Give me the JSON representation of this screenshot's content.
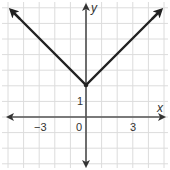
{
  "chart_data": {
    "type": "line",
    "title": "",
    "function": "y = |x| + 2",
    "xlabel": "x",
    "ylabel": "y",
    "xlim": [
      -5.1,
      5
    ],
    "ylim": [
      -3.3,
      7.3
    ],
    "grid": true,
    "grid_step": 1,
    "x_tick_labels": [
      {
        "value": -3,
        "label": "−3"
      },
      {
        "value": 0,
        "label": "0"
      },
      {
        "value": 3,
        "label": "3"
      }
    ],
    "y_tick_labels": [
      {
        "value": 1,
        "label": "1"
      }
    ],
    "series": [
      {
        "name": "y = |x| + 2",
        "x": [
          -4.9,
          -3,
          0,
          3,
          4.9
        ],
        "y": [
          6.9,
          5,
          2,
          5,
          6.9
        ],
        "arrows_at_ends": true
      }
    ],
    "vertex": {
      "x": 0,
      "y": 2
    }
  },
  "labels": {
    "x_axis": "x",
    "y_axis": "y",
    "tick_neg3": "−3",
    "tick_0": "0",
    "tick_3": "3",
    "tick_y1": "1"
  }
}
